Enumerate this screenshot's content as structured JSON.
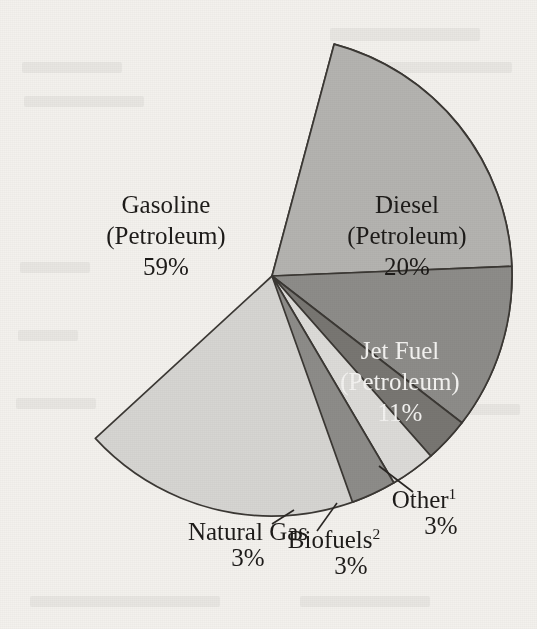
{
  "figure": {
    "background_color": "#f3f1ed",
    "outline_color": "#3b3834",
    "center_x": 272,
    "center_y": 276,
    "radius": 240
  },
  "chart_data": {
    "type": "pie",
    "title": "",
    "subtitle": "",
    "xlabel": "",
    "ylabel": "",
    "legend_position": "none",
    "grid": false,
    "units": "percent",
    "total": 99,
    "categories": [
      "Gasoline (Petroleum)",
      "Diesel (Petroleum)",
      "Jet Fuel (Petroleum)",
      "Other",
      "Biofuels",
      "Natural Gas"
    ],
    "values": [
      59,
      20,
      11,
      3,
      3,
      3
    ],
    "slices": [
      {
        "key": "gasoline",
        "name": "Gasoline",
        "qualifier": "(Petroleum)",
        "value_label": "59%",
        "value": 59,
        "color": "#d6d5d2",
        "label_placement": "inside",
        "label_color": "dark",
        "footnote_marker": "",
        "label_x": 166,
        "label_y": 213,
        "start_angle": 285,
        "end_angle": 497.4
      },
      {
        "key": "diesel",
        "name": "Diesel",
        "qualifier": "(Petroleum)",
        "value_label": "20%",
        "value": 20,
        "color": "#b4b3b0",
        "label_placement": "inside",
        "label_color": "dark",
        "footnote_marker": "",
        "label_x": 407,
        "label_y": 213,
        "start_angle": 285,
        "end_angle": 357.7
      },
      {
        "key": "jet-fuel",
        "name": "Jet Fuel",
        "qualifier": "(Petroleum)",
        "value_label": "11%",
        "value": 11,
        "color": "#8d8c89",
        "label_placement": "inside",
        "label_color": "light",
        "footnote_marker": "",
        "label_x": 400,
        "label_y": 359,
        "start_angle": 357.7,
        "end_angle": 397.7
      },
      {
        "key": "other",
        "name": "Other",
        "qualifier": "",
        "value_label": "3%",
        "value": 3,
        "color": "#787672",
        "label_placement": "outside",
        "label_color": "dark",
        "footnote_marker": "1",
        "label_x": 424,
        "label_y": 508,
        "value_x": 441,
        "value_y": 534,
        "leader_from_x": 379,
        "leader_from_y": 466,
        "leader_to_x": 413,
        "leader_to_y": 492,
        "start_angle": 397.7,
        "end_angle": 408.6
      },
      {
        "key": "biofuels",
        "name": "Biofuels",
        "qualifier": "",
        "value_label": "3%",
        "value": 3,
        "color": "#dcdbd8",
        "label_placement": "outside",
        "label_color": "dark",
        "footnote_marker": "2",
        "label_x": 334,
        "label_y": 548,
        "value_x": 351,
        "value_y": 574,
        "leader_from_x": 337,
        "leader_from_y": 503,
        "leader_to_x": 317,
        "leader_to_y": 531,
        "start_angle": 408.6,
        "end_angle": 419.5
      },
      {
        "key": "natural-gas",
        "name": "Natural Gas",
        "qualifier": "",
        "value_label": "3%",
        "value": 3,
        "color": "#8d8c89",
        "label_placement": "outside",
        "label_color": "dark",
        "footnote_marker": "",
        "label_x": 248,
        "label_y": 540,
        "value_x": 248,
        "value_y": 566,
        "leader_from_x": 294,
        "leader_from_y": 510,
        "leader_to_x": 272,
        "leader_to_y": 524,
        "start_angle": 419.5,
        "end_angle": 430.4
      }
    ]
  }
}
